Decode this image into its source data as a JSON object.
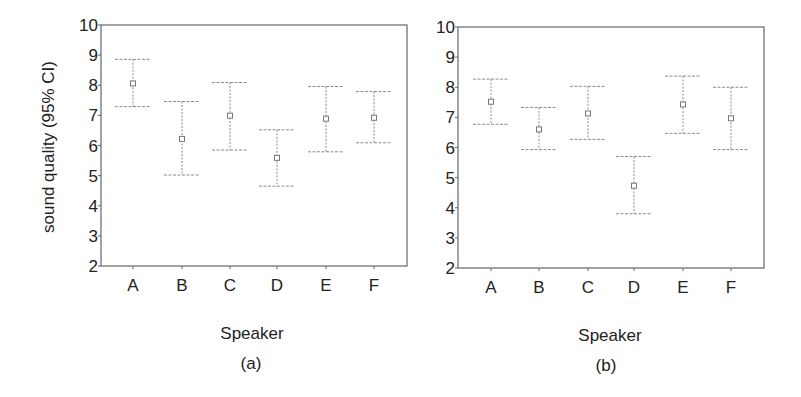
{
  "figure": {
    "panels": [
      {
        "caption": "(a)",
        "xlabel": "Speaker",
        "ylabel": "sound quality (95% CI)"
      },
      {
        "caption": "(b)",
        "xlabel": "Speaker",
        "ylabel": ""
      }
    ]
  },
  "chart_data": [
    {
      "type": "errorbar",
      "title": "",
      "caption": "(a)",
      "xlabel": "Speaker",
      "ylabel": "sound quality (95% CI)",
      "ylim": [
        2,
        10
      ],
      "yticks": [
        2,
        3,
        4,
        5,
        6,
        7,
        8,
        9,
        10
      ],
      "grid": false,
      "categories": [
        "A",
        "B",
        "C",
        "D",
        "E",
        "F"
      ],
      "mean": [
        8.06,
        6.22,
        6.99,
        5.59,
        6.89,
        6.92
      ],
      "upper": [
        8.86,
        7.46,
        8.09,
        6.52,
        7.96,
        7.79
      ],
      "lower": [
        7.29,
        5.02,
        5.85,
        4.65,
        5.79,
        6.09
      ],
      "marker": "open-square",
      "colors": {
        "bars": "#8a8a8a",
        "marker": "#777777",
        "frame": "#666666"
      }
    },
    {
      "type": "errorbar",
      "title": "",
      "caption": "(b)",
      "xlabel": "Speaker",
      "ylabel": "",
      "ylim": [
        2,
        10
      ],
      "yticks": [
        2,
        3,
        4,
        5,
        6,
        7,
        8,
        9,
        10
      ],
      "grid": false,
      "categories": [
        "A",
        "B",
        "C",
        "D",
        "E",
        "F"
      ],
      "mean": [
        7.52,
        6.6,
        7.13,
        4.73,
        7.43,
        6.97
      ],
      "upper": [
        8.27,
        7.33,
        8.03,
        5.7,
        8.37,
        8.0
      ],
      "lower": [
        6.77,
        5.93,
        6.27,
        3.8,
        6.47,
        5.93
      ],
      "marker": "open-square",
      "colors": {
        "bars": "#8a8a8a",
        "marker": "#777777",
        "frame": "#666666"
      }
    }
  ]
}
